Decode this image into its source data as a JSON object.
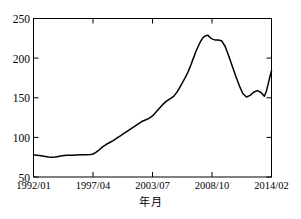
{
  "chart_data": {
    "type": "line",
    "title": "",
    "xlabel": "年月",
    "ylabel": "",
    "ylim": [
      50,
      250
    ],
    "yticks": [
      50,
      100,
      150,
      200,
      250
    ],
    "ytick_labels": [
      "50",
      "100",
      "150",
      "200",
      "250"
    ],
    "xtick_labels": [
      "1992/01",
      "1997/04",
      "2003/07",
      "2008/10",
      "2014/02"
    ],
    "xtick_positions": [
      0,
      0.25,
      0.5,
      0.75,
      1.0
    ],
    "grid": false,
    "legend": null,
    "line_color": "#000000",
    "line_width": 1.5,
    "axis_color": "#000000",
    "background": "#ffffff",
    "x": [
      0.0,
      0.012,
      0.025,
      0.038,
      0.05,
      0.063,
      0.075,
      0.09,
      0.105,
      0.12,
      0.14,
      0.16,
      0.18,
      0.2,
      0.22,
      0.24,
      0.25,
      0.262,
      0.275,
      0.29,
      0.305,
      0.32,
      0.335,
      0.35,
      0.365,
      0.38,
      0.395,
      0.41,
      0.425,
      0.44,
      0.455,
      0.47,
      0.485,
      0.5,
      0.515,
      0.53,
      0.545,
      0.56,
      0.575,
      0.59,
      0.605,
      0.62,
      0.635,
      0.65,
      0.662,
      0.672,
      0.682,
      0.692,
      0.702,
      0.712,
      0.722,
      0.732,
      0.742,
      0.752,
      0.762,
      0.775,
      0.79,
      0.805,
      0.82,
      0.835,
      0.85,
      0.865,
      0.88,
      0.895,
      0.91,
      0.925,
      0.94,
      0.955,
      0.97,
      0.985,
      1.0
    ],
    "values": [
      78,
      77.5,
      77,
      76.5,
      76,
      75.3,
      75,
      75.2,
      76,
      76.8,
      77.3,
      77.6,
      77.8,
      78,
      78.2,
      78.5,
      79,
      81,
      84,
      88,
      91,
      93.5,
      96,
      99,
      102,
      105,
      108,
      111,
      114,
      117,
      120,
      122,
      124,
      127,
      132,
      137,
      142,
      146,
      149,
      152,
      158,
      166,
      174,
      183,
      192,
      200,
      208,
      215,
      221,
      226,
      228,
      229,
      226,
      224,
      223,
      223,
      222,
      215,
      203,
      190,
      177,
      165,
      155,
      151,
      153,
      157,
      159,
      157,
      153,
      151,
      149
    ],
    "series_note": "single series index, monthly from 1992/01 to 2014/02",
    "annotations": []
  },
  "chart_data_tail": {
    "x": [
      0.97,
      0.978,
      0.985,
      0.992,
      1.0
    ],
    "values": [
      152,
      158,
      166,
      175,
      184
    ]
  }
}
